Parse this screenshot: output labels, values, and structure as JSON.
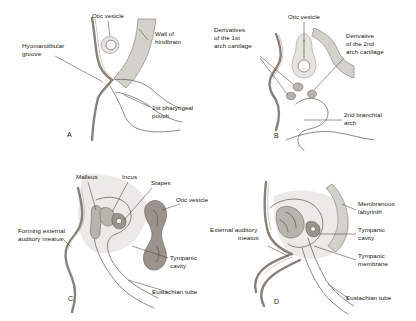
{
  "figure": {
    "background_color": "#ffffff",
    "ink_color": "#17140f",
    "contour_color": "#8a8078",
    "tissue_gray": "#d4d0cb",
    "organ_gray": "#9a948d"
  },
  "panels": [
    {
      "letter": "A",
      "name": "panel-a",
      "labels": [
        {
          "id": "otic-vesicle",
          "text": "Otic vesicle"
        },
        {
          "id": "wall-of-hindbrain",
          "text_line1": "Wall of",
          "text_line2": "hindbrain"
        },
        {
          "id": "hyomandibular-groove",
          "text_line1": "Hyomandibular",
          "text_line2": "groove"
        },
        {
          "id": "first-pharyngeal-pouch",
          "text_line1": "1st pharyngeal",
          "text_line2": "pouch"
        }
      ]
    },
    {
      "letter": "B",
      "name": "panel-b",
      "labels": [
        {
          "id": "otic-vesicle",
          "text": "Otic vesicle"
        },
        {
          "id": "derivatives-1st-arch-cartilage",
          "text_line1": "Derivatives",
          "text_line2": "of the 1st",
          "text_line3": "arch cartilage"
        },
        {
          "id": "derivative-2nd-arch-cartilage",
          "text_line1": "Derivative",
          "text_line2": "of the 2nd",
          "text_line3": "arch cartilage"
        },
        {
          "id": "second-branchial-arch",
          "text_line1": "2nd branchial",
          "text_line2": "arch"
        }
      ]
    },
    {
      "letter": "C",
      "name": "panel-c",
      "labels": [
        {
          "id": "malleus",
          "text": "Malleus"
        },
        {
          "id": "incus",
          "text": "Incus"
        },
        {
          "id": "stapes",
          "text": "Stapes"
        },
        {
          "id": "otic-vesicle",
          "text": "Otic vesicle"
        },
        {
          "id": "forming-external-auditory-meatus",
          "text_line1": "Forming external",
          "text_line2": "auditory meatus"
        },
        {
          "id": "tympanic-cavity",
          "text_line1": "Tympanic",
          "text_line2": "cavity"
        },
        {
          "id": "eustachian-tube",
          "text": "Eustachian tube"
        }
      ]
    },
    {
      "letter": "D",
      "name": "panel-d",
      "labels": [
        {
          "id": "membranous-labyrinth",
          "text_line1": "Membranous",
          "text_line2": "labyrinth"
        },
        {
          "id": "external-auditory-meatus",
          "text_line1": "External auditory",
          "text_line2": "meatus"
        },
        {
          "id": "tympanic-cavity",
          "text_line1": "Tympanic",
          "text_line2": "cavity"
        },
        {
          "id": "tympanic-membrane",
          "text_line1": "Tympanic",
          "text_line2": "membrane"
        },
        {
          "id": "eustachian-tube",
          "text": "Eustachian tube"
        }
      ]
    }
  ]
}
